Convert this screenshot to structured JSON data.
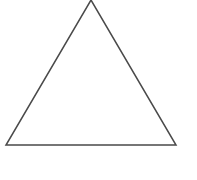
{
  "canvas": {
    "width": 197,
    "height": 180,
    "background_color": "#ffffff",
    "description": "Line drawing of a single triangle outline on a plain white background"
  },
  "figure": {
    "shape_name": "triangle",
    "shape_label": "Triangle",
    "fill": "none",
    "stroke_color": "#4a4a4a",
    "stroke_width": 1.5,
    "vertices": [
      {
        "name": "apex",
        "x": 91,
        "y": 0
      },
      {
        "name": "bottom-right",
        "x": 176,
        "y": 145
      },
      {
        "name": "bottom-left",
        "x": 6,
        "y": 145
      }
    ],
    "points_attr": "91,0 176,145 6,145",
    "edges": [
      {
        "name": "left-edge",
        "from": "apex",
        "to": "bottom-left"
      },
      {
        "name": "right-edge",
        "from": "apex",
        "to": "bottom-right"
      },
      {
        "name": "base-edge",
        "from": "bottom-left",
        "to": "bottom-right"
      }
    ]
  },
  "labels": {
    "caption": "",
    "annotations": []
  }
}
